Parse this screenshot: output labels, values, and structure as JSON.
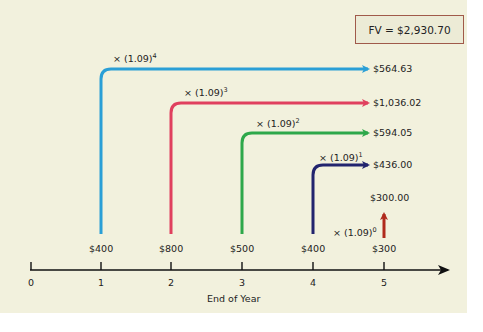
{
  "title_box": {
    "text": "FV = $2,930.70",
    "border_color": "#a05a4a"
  },
  "axis": {
    "label": "End of Year",
    "ticks": [
      "0",
      "1",
      "2",
      "3",
      "4",
      "5"
    ]
  },
  "cash_flows": [
    {
      "year": "1",
      "amount": "$400",
      "multiplier_base": "× (1.09)",
      "exponent": "4",
      "future_value": "$564.63",
      "color": "#2a9fd6"
    },
    {
      "year": "2",
      "amount": "$800",
      "multiplier_base": "× (1.09)",
      "exponent": "3",
      "future_value": "$1,036.02",
      "color": "#e0405e"
    },
    {
      "year": "3",
      "amount": "$500",
      "multiplier_base": "× (1.09)",
      "exponent": "2",
      "future_value": "$594.05",
      "color": "#2ea84a"
    },
    {
      "year": "4",
      "amount": "$400",
      "multiplier_base": "× (1.09)",
      "exponent": "1",
      "future_value": "$436.00",
      "color": "#22246e"
    },
    {
      "year": "5",
      "amount": "$300",
      "multiplier_base": "× (1.09)",
      "exponent": "0",
      "future_value": "$300.00",
      "color": "#b02a1c"
    }
  ],
  "colors": {
    "background": "#f2f1dd",
    "axis": "#111111"
  }
}
